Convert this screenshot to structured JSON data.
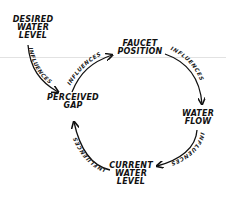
{
  "diagram": {
    "type": "causal-loop",
    "nodes": [
      {
        "id": "desired",
        "lines": [
          "DESIRED",
          "WATER",
          "LEVEL"
        ]
      },
      {
        "id": "faucet",
        "lines": [
          "FAUCET",
          "POSITION"
        ]
      },
      {
        "id": "gap",
        "lines": [
          "PERCEIVED",
          "GAP"
        ]
      },
      {
        "id": "flow",
        "lines": [
          "WATER",
          "FLOW"
        ]
      },
      {
        "id": "current",
        "lines": [
          "CURRENT",
          "WATER",
          "LEVEL"
        ]
      }
    ],
    "edges": [
      {
        "from": "desired",
        "to": "gap",
        "label": "INFLUENCES"
      },
      {
        "from": "gap",
        "to": "faucet",
        "label": "INFLUENCES"
      },
      {
        "from": "faucet",
        "to": "flow",
        "label": "INFLUENCES"
      },
      {
        "from": "flow",
        "to": "current",
        "label": "INFLUENCES"
      },
      {
        "from": "current",
        "to": "gap",
        "label": "INFLUENCES"
      }
    ],
    "colors": {
      "ink": "#111111",
      "background": "#ffffff",
      "guide_line": "#e2e2e2"
    }
  }
}
